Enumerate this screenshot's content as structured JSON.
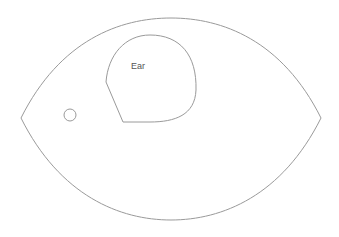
{
  "diagram": {
    "shapes": [
      {
        "id": "outer-leaf",
        "type": "lens",
        "left": [
          21,
          118
        ],
        "right": [
          321,
          118
        ],
        "top_y": 18,
        "bottom_y": 220
      },
      {
        "id": "ear-region",
        "type": "region",
        "label": "Ear"
      },
      {
        "id": "eye-dot",
        "type": "circle",
        "cx": 70,
        "cy": 115,
        "r": 6
      }
    ],
    "labels": {
      "ear": "Ear"
    },
    "colors": {
      "stroke": "#9a9a9a",
      "text": "#555555",
      "background": "#ffffff"
    }
  }
}
